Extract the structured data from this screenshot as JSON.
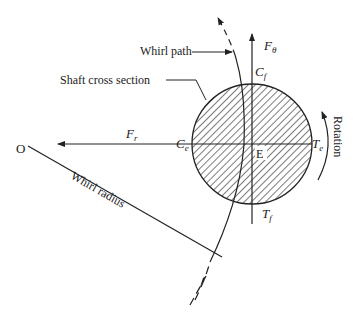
{
  "diagram": {
    "labels": {
      "whirl_path": "Whirl path",
      "shaft_cross_section": "Shaft cross section",
      "rotation": "Rotation",
      "whirl_radius": "Whirl radius",
      "origin": "O",
      "center": "E",
      "f_theta_main": "F",
      "f_theta_sub": "θ",
      "f_r_main": "F",
      "f_r_sub": "r",
      "c_f_main": "C",
      "c_f_sub": "f",
      "c_e_main": "C",
      "c_e_sub": "e",
      "t_e_main": "T",
      "t_e_sub": "e",
      "t_f_main": "T",
      "t_f_sub": "f"
    },
    "colors": {
      "stroke": "#222222",
      "background": "#ffffff"
    }
  }
}
